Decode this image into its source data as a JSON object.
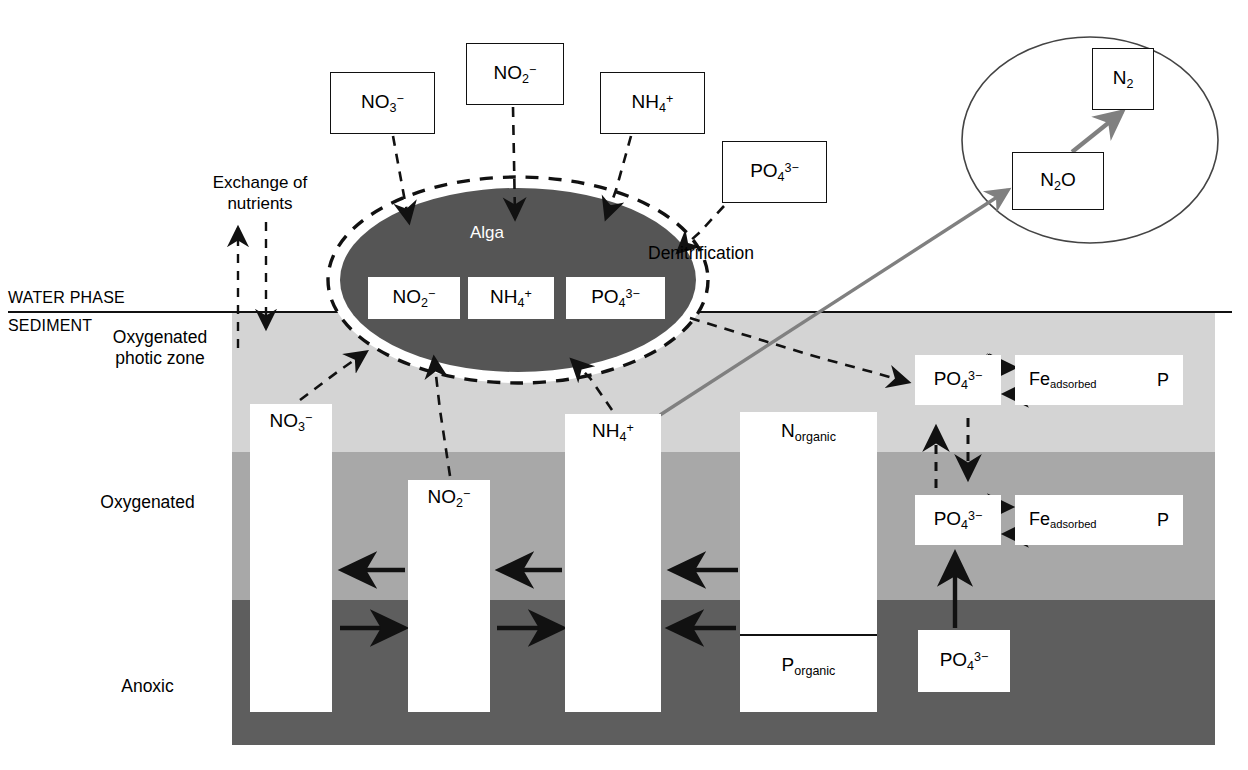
{
  "diagram": {
    "zones": {
      "water_phase_label": "WATER PHASE",
      "sediment_label": "SEDIMENT",
      "photic_label": "Oxygenated\nphotic zone",
      "photic_line1": "Oxygenated",
      "photic_line2": "photic zone",
      "oxygenated_label": "Oxygenated",
      "anoxic_label": "Anoxic"
    },
    "annotations": {
      "exchange_line1": "Exchange of",
      "exchange_line2": "nutrients",
      "denitrification": "Denitrification",
      "alga": "Alga"
    },
    "water_boxes": [
      {
        "id": "no3-top",
        "formula": "NO",
        "sub": "3",
        "sup": "−"
      },
      {
        "id": "no2-top",
        "formula": "NO",
        "sub": "2",
        "sup": "−"
      },
      {
        "id": "nh4-top",
        "formula": "NH",
        "sub": "4",
        "sup": "+"
      },
      {
        "id": "po43-top",
        "formula": "PO",
        "sub": "4",
        "sup": "3−"
      }
    ],
    "alga_boxes": [
      {
        "id": "no2-alga",
        "formula": "NO",
        "sub": "2",
        "sup": "−"
      },
      {
        "id": "nh4-alga",
        "formula": "NH",
        "sub": "4",
        "sup": "+"
      },
      {
        "id": "po4-alga",
        "formula": "PO",
        "sub": "4",
        "sup": "3−"
      }
    ],
    "sediment_columns": [
      {
        "id": "col-no3",
        "formula": "NO",
        "sub": "3",
        "sup": "−"
      },
      {
        "id": "col-no2",
        "formula": "NO",
        "sub": "2",
        "sup": "−"
      },
      {
        "id": "col-nh4",
        "formula": "NH",
        "sub": "4",
        "sup": "+"
      }
    ],
    "organic_column": {
      "nitrogen": "N",
      "nitrogen_sub": "organic",
      "phosphorus": "P",
      "phosphorus_sub": "organic"
    },
    "phosphorus_boxes": [
      {
        "id": "po4-r1",
        "formula": "PO",
        "sub": "4",
        "sup": "3−",
        "zone": "Oxygenated photic zone"
      },
      {
        "id": "po4-r2",
        "formula": "PO",
        "sub": "4",
        "sup": "3−",
        "zone": "Oxygenated"
      },
      {
        "id": "po4-r3",
        "formula": "PO",
        "sub": "4",
        "sup": "3−",
        "zone": "Anoxic"
      }
    ],
    "fe_boxes": [
      {
        "id": "fe1",
        "element": "Fe",
        "sub": "adsorbed",
        "suffix": "P"
      },
      {
        "id": "fe2",
        "element": "Fe",
        "sub": "adsorbed",
        "suffix": "P"
      }
    ],
    "denitrification_bubble": [
      {
        "id": "n2o",
        "formula": "N",
        "sub": "2",
        "suffix": "O"
      },
      {
        "id": "n2",
        "formula": "N",
        "sub": "2",
        "suffix": ""
      }
    ],
    "colors": {
      "photic_band": "#d4d4d4",
      "oxygenated_band": "#a8a8a8",
      "anoxic_band": "#5e5e5e",
      "alga_fill": "#555555",
      "stroke": "#111111",
      "gray_arrow": "#808080"
    }
  }
}
